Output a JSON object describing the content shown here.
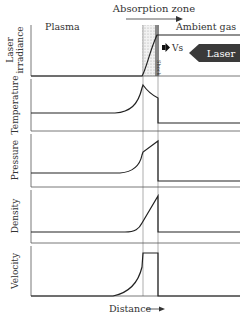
{
  "title_annotation": "Absorption zone",
  "region_labels": {
    "left": "Plasma",
    "right": "Ambient gas"
  },
  "shock_label": "Shock",
  "velocity_label": "Vs",
  "laser_label": "Laser",
  "x_axis_label": "Distance",
  "panels": [
    {
      "name": "laser-irradiance",
      "label_line1": "Laser",
      "label_line2": "irradiance"
    },
    {
      "name": "temperature",
      "label_line1": "Temperature",
      "label_line2": ""
    },
    {
      "name": "pressure",
      "label_line1": "Pressure",
      "label_line2": ""
    },
    {
      "name": "density",
      "label_line1": "Density",
      "label_line2": ""
    },
    {
      "name": "velocity",
      "label_line1": "Velocity",
      "label_line2": ""
    }
  ],
  "colors": {
    "line": "#222222",
    "laser_arrow": "#3a3a3a",
    "zone_fill": "#e6e6e6"
  }
}
